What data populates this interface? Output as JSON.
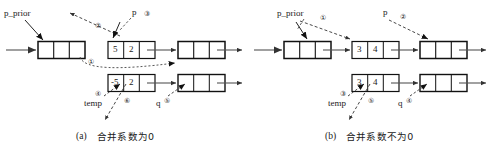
{
  "figure": {
    "title_hidden": "",
    "panels": [
      {
        "id": "panel-a",
        "caption_index": "(a)",
        "caption_text": "合并系数为0",
        "labels": {
          "p_prior": "p_prior",
          "p": "p",
          "temp": "temp",
          "q": "q"
        },
        "step_marks": {
          "p_prior_step": "①",
          "arrow_up_step": "②",
          "p_step": "③",
          "temp_step_left": "④",
          "q_step": "⑤",
          "temp_step_right": "⑥"
        },
        "nodes": {
          "top_row": [
            {
              "name": "node-prior",
              "coef": "",
              "exp": ""
            },
            {
              "name": "node-p",
              "coef": "5",
              "exp": "2"
            },
            {
              "name": "node-next",
              "coef": "",
              "exp": ""
            }
          ],
          "bottom_row": [
            {
              "name": "node-temp",
              "coef": "-5",
              "exp": "2"
            },
            {
              "name": "node-q",
              "coef": "",
              "exp": ""
            }
          ]
        }
      },
      {
        "id": "panel-b",
        "caption_index": "(b)",
        "caption_text": "合并系数不为0",
        "labels": {
          "p_prior": "p_prior",
          "p": "p",
          "temp": "temp",
          "q": "q"
        },
        "step_marks": {
          "p_prior_step": "①",
          "p_step": "②",
          "temp_step_left": "③",
          "q_step": "④",
          "temp_step_right": "⑤"
        },
        "nodes": {
          "top_row": [
            {
              "name": "node-prior",
              "coef": "",
              "exp": ""
            },
            {
              "name": "node-p",
              "coef": "3",
              "exp": "4"
            },
            {
              "name": "node-next",
              "coef": "",
              "exp": ""
            }
          ],
          "bottom_row": [
            {
              "name": "node-temp",
              "coef": "3",
              "exp": "4"
            },
            {
              "name": "node-q",
              "coef": "",
              "exp": ""
            }
          ]
        }
      }
    ],
    "colors": {
      "ink": "#1a1a1a",
      "line": "#555555",
      "background": "#ffffff"
    }
  }
}
